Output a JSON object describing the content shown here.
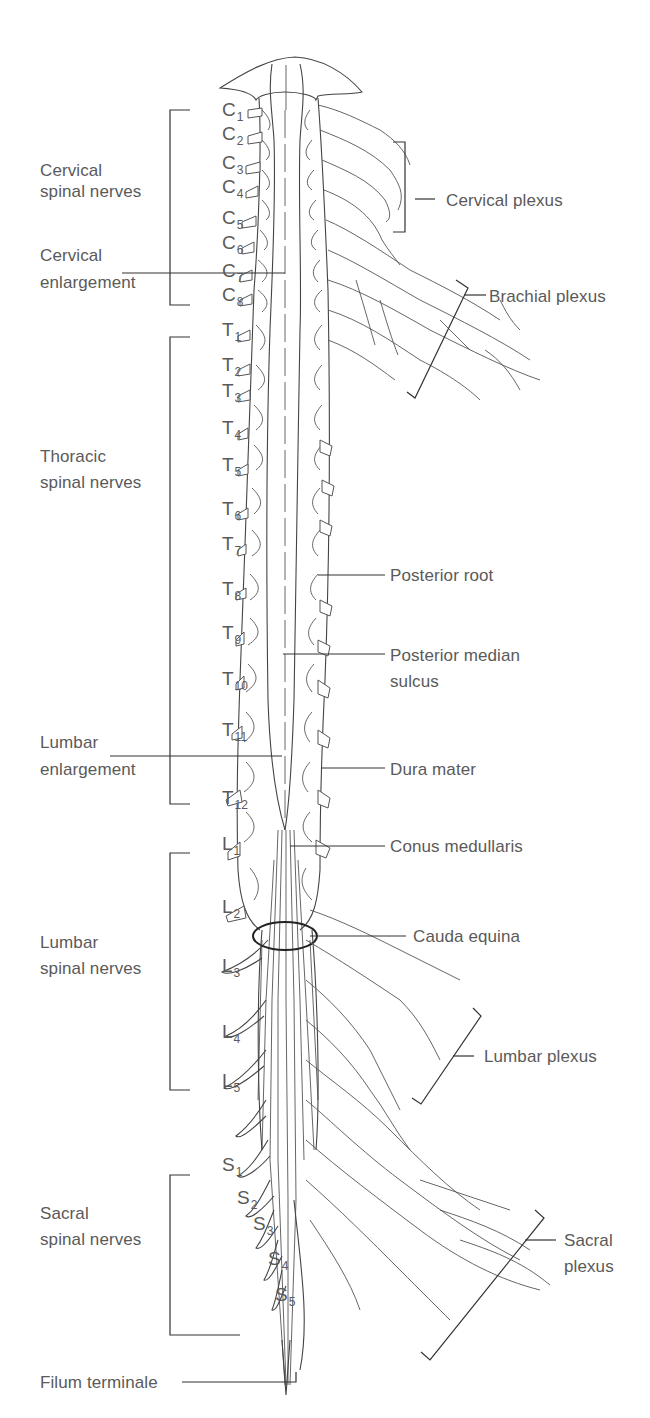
{
  "figure": {
    "left_labels": {
      "cervical_spinal_nerves": [
        "Cervical",
        "spinal nerves"
      ],
      "cervical_enlargement": [
        "Cervical",
        "enlargement"
      ],
      "thoracic_spinal_nerves": [
        "Thoracic",
        "spinal nerves"
      ],
      "lumbar_enlargement": [
        "Lumbar",
        "enlargement"
      ],
      "lumbar_spinal_nerves": [
        "Lumbar",
        "spinal nerves"
      ],
      "sacral_spinal_nerves": [
        "Sacral",
        "spinal nerves"
      ],
      "filum_terminale": "Filum terminale"
    },
    "right_labels": {
      "cervical_plexus": "Cervical plexus",
      "brachial_plexus": "Brachial plexus",
      "posterior_root": "Posterior root",
      "posterior_median_sulcus": [
        "Posterior median",
        "sulcus"
      ],
      "dura_mater": "Dura mater",
      "conus_medullaris": "Conus medullaris",
      "cauda_equina": "Cauda equina",
      "lumbar_plexus": "Lumbar plexus",
      "sacral_plexus": [
        "Sacral",
        "plexus"
      ]
    },
    "segments": {
      "cervical": [
        {
          "letter": "C",
          "num": "1",
          "x": 222,
          "y": 112
        },
        {
          "letter": "C",
          "num": "2",
          "x": 222,
          "y": 136
        },
        {
          "letter": "C",
          "num": "3",
          "x": 222,
          "y": 165
        },
        {
          "letter": "C",
          "num": "4",
          "x": 222,
          "y": 189
        },
        {
          "letter": "C",
          "num": "5",
          "x": 222,
          "y": 220
        },
        {
          "letter": "C",
          "num": "6",
          "x": 222,
          "y": 245
        },
        {
          "letter": "C",
          "num": "7",
          "x": 222,
          "y": 273
        },
        {
          "letter": "C",
          "num": "8",
          "x": 222,
          "y": 297
        }
      ],
      "thoracic": [
        {
          "letter": "T",
          "num": "1",
          "x": 222,
          "y": 332
        },
        {
          "letter": "T",
          "num": "2",
          "x": 222,
          "y": 367
        },
        {
          "letter": "T",
          "num": "3",
          "x": 222,
          "y": 393
        },
        {
          "letter": "T",
          "num": "4",
          "x": 222,
          "y": 430
        },
        {
          "letter": "T",
          "num": "5",
          "x": 222,
          "y": 467
        },
        {
          "letter": "T",
          "num": "6",
          "x": 222,
          "y": 511
        },
        {
          "letter": "T",
          "num": "7",
          "x": 222,
          "y": 546
        },
        {
          "letter": "T",
          "num": "8",
          "x": 222,
          "y": 591
        },
        {
          "letter": "T",
          "num": "9",
          "x": 222,
          "y": 635
        },
        {
          "letter": "T",
          "num": "10",
          "x": 222,
          "y": 681
        },
        {
          "letter": "T",
          "num": "11",
          "x": 222,
          "y": 732
        },
        {
          "letter": "T",
          "num": "12",
          "x": 222,
          "y": 800
        }
      ],
      "lumbar": [
        {
          "letter": "L",
          "num": "1",
          "x": 222,
          "y": 846
        },
        {
          "letter": "L",
          "num": "2",
          "x": 222,
          "y": 909
        },
        {
          "letter": "L",
          "num": "3",
          "x": 222,
          "y": 968
        },
        {
          "letter": "L",
          "num": "4",
          "x": 222,
          "y": 1034
        },
        {
          "letter": "L",
          "num": "5",
          "x": 222,
          "y": 1083
        }
      ],
      "sacral": [
        {
          "letter": "S",
          "num": "1",
          "x": 222,
          "y": 1167
        },
        {
          "letter": "S",
          "num": "2",
          "x": 237,
          "y": 1200
        },
        {
          "letter": "S",
          "num": "3",
          "x": 253,
          "y": 1226
        },
        {
          "letter": "S",
          "num": "4",
          "x": 268,
          "y": 1261
        },
        {
          "letter": "S",
          "num": "5",
          "x": 275,
          "y": 1297
        }
      ]
    },
    "colors": {
      "ink": "#444444",
      "label_text": "#5a5a5a",
      "background": "#ffffff"
    }
  }
}
